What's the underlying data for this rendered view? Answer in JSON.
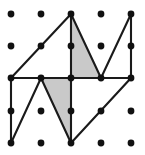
{
  "figure": {
    "canvas": {
      "width": 145,
      "height": 155
    },
    "background_color": "#ffffff",
    "dot_color": "#111111",
    "dot_radius": 3.4,
    "line_color": "#1a1a1a",
    "line_width": 2.1,
    "shade_color": "#c9c9c9",
    "grid": {
      "columns": 5,
      "rows": 5,
      "x_positions": [
        11,
        41,
        71,
        101,
        131
      ],
      "y_positions": [
        14,
        46,
        78,
        111,
        143
      ]
    },
    "dots": [
      {
        "name": "dot-c0-r0",
        "x": 11,
        "y": 14
      },
      {
        "name": "dot-c1-r0",
        "x": 41,
        "y": 14
      },
      {
        "name": "dot-c2-r0",
        "x": 71,
        "y": 14
      },
      {
        "name": "dot-c3-r0",
        "x": 101,
        "y": 14
      },
      {
        "name": "dot-c4-r0",
        "x": 131,
        "y": 14
      },
      {
        "name": "dot-c0-r1",
        "x": 11,
        "y": 46
      },
      {
        "name": "dot-c1-r1",
        "x": 41,
        "y": 46
      },
      {
        "name": "dot-c2-r1",
        "x": 71,
        "y": 46
      },
      {
        "name": "dot-c3-r1",
        "x": 101,
        "y": 46
      },
      {
        "name": "dot-c4-r1",
        "x": 131,
        "y": 46
      },
      {
        "name": "dot-c0-r2",
        "x": 11,
        "y": 78
      },
      {
        "name": "dot-c1-r2",
        "x": 41,
        "y": 78
      },
      {
        "name": "dot-c2-r2",
        "x": 71,
        "y": 78
      },
      {
        "name": "dot-c3-r2",
        "x": 101,
        "y": 78
      },
      {
        "name": "dot-c4-r2",
        "x": 131,
        "y": 78
      },
      {
        "name": "dot-c0-r3",
        "x": 11,
        "y": 111
      },
      {
        "name": "dot-c1-r3",
        "x": 41,
        "y": 111
      },
      {
        "name": "dot-c2-r3",
        "x": 71,
        "y": 111
      },
      {
        "name": "dot-c3-r3",
        "x": 101,
        "y": 111
      },
      {
        "name": "dot-c4-r3",
        "x": 131,
        "y": 111
      },
      {
        "name": "dot-c0-r4",
        "x": 11,
        "y": 143
      },
      {
        "name": "dot-c1-r4",
        "x": 41,
        "y": 143
      },
      {
        "name": "dot-c2-r4",
        "x": 71,
        "y": 143
      },
      {
        "name": "dot-c3-r4",
        "x": 101,
        "y": 143
      },
      {
        "name": "dot-c4-r4",
        "x": 131,
        "y": 143
      }
    ],
    "shaded_regions": [
      {
        "name": "shaded-triangle-upper",
        "points": "71,14 101,78 71,78",
        "fill": "#c9c9c9"
      },
      {
        "name": "shaded-triangle-lower",
        "points": "41,78 71,78 71,143",
        "fill": "#c9c9c9"
      }
    ],
    "edges": [
      {
        "name": "edge-left-vertical",
        "x1": 11,
        "y1": 78,
        "x2": 11,
        "y2": 143
      },
      {
        "name": "edge-left-rising-diagonal",
        "x1": 11,
        "y1": 78,
        "x2": 71,
        "y2": 14
      },
      {
        "name": "edge-center-vertical",
        "x1": 71,
        "y1": 14,
        "x2": 71,
        "y2": 143
      },
      {
        "name": "edge-upper-right-falling-diagonal",
        "x1": 71,
        "y1": 14,
        "x2": 101,
        "y2": 78
      },
      {
        "name": "edge-upper-right-rising-diagonal",
        "x1": 101,
        "y1": 78,
        "x2": 131,
        "y2": 14
      },
      {
        "name": "edge-right-vertical",
        "x1": 131,
        "y1": 14,
        "x2": 131,
        "y2": 78
      },
      {
        "name": "edge-middle-horizontal",
        "x1": 11,
        "y1": 78,
        "x2": 131,
        "y2": 78
      },
      {
        "name": "edge-lower-left-vee-left",
        "x1": 11,
        "y1": 143,
        "x2": 41,
        "y2": 78
      },
      {
        "name": "edge-lower-left-vee-right",
        "x1": 41,
        "y1": 78,
        "x2": 71,
        "y2": 143
      },
      {
        "name": "edge-lower-right-diagonal",
        "x1": 71,
        "y1": 143,
        "x2": 131,
        "y2": 78
      }
    ]
  }
}
